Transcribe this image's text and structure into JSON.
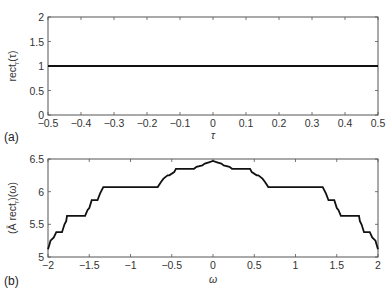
{
  "chart_data": [
    {
      "panel": "(a)",
      "type": "line",
      "title": "",
      "xlabel": "τ",
      "ylabel": "rect_r(τ)",
      "xlim": [
        -0.5,
        0.5
      ],
      "ylim": [
        0,
        2
      ],
      "xticks": [
        "-0.5",
        "-0.4",
        "-0.3",
        "-0.2",
        "-0.1",
        "0",
        "0.1",
        "0.2",
        "0.3",
        "0.4",
        "0.5"
      ],
      "yticks": [
        "0",
        "0.5",
        "1",
        "1.5",
        "2"
      ],
      "grid": false,
      "series": [
        {
          "name": "rect_r(τ)",
          "x": [
            -0.5,
            0.5
          ],
          "y": [
            1,
            1
          ]
        }
      ]
    },
    {
      "panel": "(b)",
      "type": "line",
      "title": "",
      "xlabel": "ω",
      "ylabel": "(Â rect_r)(ω)",
      "xlim": [
        -2,
        2
      ],
      "ylim": [
        5,
        6.5
      ],
      "xticks": [
        "-2",
        "-1.5",
        "-1",
        "-0.5",
        "0",
        "0.5",
        "1",
        "1.5",
        "2"
      ],
      "yticks": [
        "5",
        "5.5",
        "6",
        "6.5"
      ],
      "grid": false,
      "series": [
        {
          "name": "(Â rect_r)(ω)",
          "x": [
            -2.0,
            -1.98,
            -1.97,
            -1.93,
            -1.9,
            -1.83,
            -1.8,
            -1.78,
            -1.77,
            -1.55,
            -1.52,
            -1.5,
            -1.47,
            -1.4,
            -1.37,
            -1.33,
            -0.67,
            -0.63,
            -0.6,
            -0.55,
            -0.53,
            -0.47,
            -0.45,
            -0.23,
            -0.2,
            -0.13,
            -0.1,
            -0.05,
            0.0,
            0.05,
            0.1,
            0.13,
            0.2,
            0.23,
            0.45,
            0.47,
            0.53,
            0.55,
            0.6,
            0.63,
            0.67,
            1.33,
            1.37,
            1.4,
            1.47,
            1.5,
            1.52,
            1.55,
            1.77,
            1.78,
            1.8,
            1.83,
            1.9,
            1.93,
            1.97,
            1.98,
            2.0
          ],
          "y": [
            5.12,
            5.2,
            5.25,
            5.3,
            5.38,
            5.38,
            5.5,
            5.55,
            5.63,
            5.63,
            5.72,
            5.75,
            5.87,
            5.87,
            5.97,
            6.07,
            6.07,
            6.15,
            6.2,
            6.25,
            6.25,
            6.3,
            6.35,
            6.35,
            6.38,
            6.4,
            6.43,
            6.45,
            6.47,
            6.45,
            6.43,
            6.4,
            6.38,
            6.35,
            6.35,
            6.3,
            6.25,
            6.25,
            6.2,
            6.15,
            6.07,
            6.07,
            5.97,
            5.87,
            5.87,
            5.75,
            5.72,
            5.63,
            5.63,
            5.55,
            5.5,
            5.38,
            5.38,
            5.3,
            5.25,
            5.2,
            5.12
          ]
        }
      ]
    }
  ],
  "panels": {
    "a": {
      "label": "(a)",
      "xlabel": "τ",
      "ylabel_main": "rect",
      "ylabel_sub": "r",
      "ylabel_arg": "(τ)"
    },
    "b": {
      "label": "(b)",
      "xlabel": "ω",
      "ylabel_main": "(Â rect",
      "ylabel_sub": "r",
      "ylabel_arg": ")(ω)"
    }
  }
}
